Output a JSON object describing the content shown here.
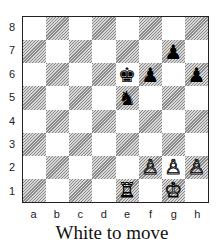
{
  "board": {
    "ranks": [
      "8",
      "7",
      "6",
      "5",
      "4",
      "3",
      "2",
      "1"
    ],
    "files": [
      "a",
      "b",
      "c",
      "d",
      "e",
      "f",
      "g",
      "h"
    ],
    "pieces": [
      {
        "square": "e6",
        "color": "black",
        "type": "king",
        "glyph": "♚"
      },
      {
        "square": "f6",
        "color": "black",
        "type": "pawn",
        "glyph": "♟"
      },
      {
        "square": "g7",
        "color": "black",
        "type": "pawn",
        "glyph": "♟"
      },
      {
        "square": "h6",
        "color": "black",
        "type": "pawn",
        "glyph": "♟"
      },
      {
        "square": "e5",
        "color": "black",
        "type": "knight",
        "glyph": "♞"
      },
      {
        "square": "e1",
        "color": "white",
        "type": "rook",
        "glyph": "♖"
      },
      {
        "square": "g1",
        "color": "white",
        "type": "king",
        "glyph": "♔"
      },
      {
        "square": "f2",
        "color": "white",
        "type": "pawn",
        "glyph": "♙"
      },
      {
        "square": "g2",
        "color": "white",
        "type": "pawn",
        "glyph": "♙"
      },
      {
        "square": "h2",
        "color": "white",
        "type": "pawn",
        "glyph": "♙"
      }
    ]
  },
  "caption": "White to move"
}
